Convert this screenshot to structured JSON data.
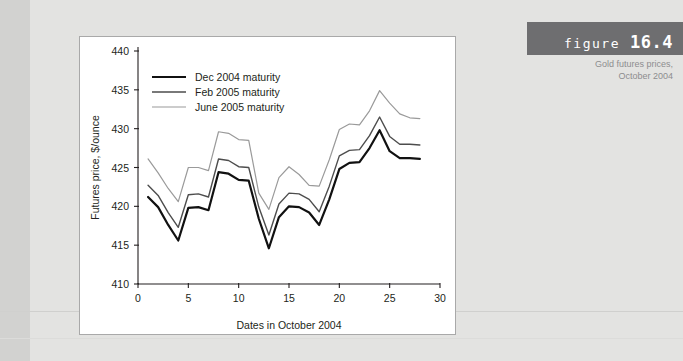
{
  "figure": {
    "label_word": "figure",
    "label_number": "16.4",
    "caption_line1": "Gold futures prices,",
    "caption_line2": "October 2004"
  },
  "chart_data": {
    "type": "line",
    "title": "Gold futures prices, October 2004",
    "xlabel": "Dates in October 2004",
    "ylabel": "Futures price, $/ounce",
    "xlim": [
      0,
      30
    ],
    "ylim": [
      410,
      440
    ],
    "xticks": [
      0,
      5,
      10,
      15,
      20,
      25,
      30
    ],
    "yticks": [
      410,
      415,
      420,
      425,
      430,
      435,
      440
    ],
    "grid": false,
    "legend_position": "upper-left",
    "x": [
      1,
      2,
      3,
      4,
      5,
      6,
      7,
      8,
      9,
      10,
      11,
      12,
      13,
      14,
      15,
      16,
      17,
      18,
      19,
      20,
      21,
      22,
      23,
      24,
      25,
      26,
      27,
      28
    ],
    "series": [
      {
        "name": "Dec 2004 maturity",
        "color": "#111111",
        "width": 2.2,
        "values": [
          421.2,
          419.9,
          417.6,
          415.6,
          419.8,
          419.9,
          419.5,
          424.4,
          424.2,
          423.4,
          423.3,
          418.4,
          414.6,
          418.6,
          420.0,
          419.9,
          419.2,
          417.6,
          420.9,
          424.8,
          425.6,
          425.7,
          427.5,
          429.8,
          427.1,
          426.2,
          426.2,
          426.1
        ]
      },
      {
        "name": "Feb 2005 maturity",
        "color": "#4d4d4d",
        "width": 1.4,
        "values": [
          422.7,
          421.4,
          419.2,
          417.3,
          421.5,
          421.6,
          421.2,
          426.1,
          425.9,
          425.1,
          425.0,
          419.9,
          416.3,
          420.3,
          421.7,
          421.6,
          420.9,
          419.3,
          422.6,
          426.5,
          427.2,
          427.3,
          429.1,
          431.5,
          429.0,
          428.0,
          428.0,
          427.9
        ]
      },
      {
        "name": "June 2005 maturity",
        "color": "#9a9a9a",
        "width": 1.2,
        "values": [
          426.1,
          424.3,
          422.3,
          420.6,
          425.0,
          425.0,
          424.6,
          429.6,
          429.4,
          428.6,
          428.5,
          421.7,
          419.6,
          423.7,
          425.1,
          424.1,
          422.7,
          422.6,
          426.0,
          429.9,
          430.6,
          430.5,
          432.3,
          434.9,
          433.3,
          431.9,
          431.4,
          431.3
        ]
      }
    ]
  }
}
